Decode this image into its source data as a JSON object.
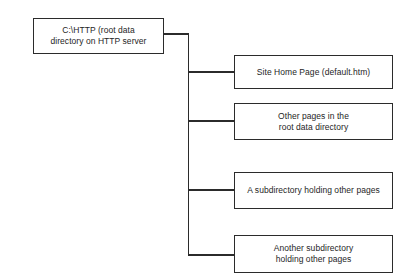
{
  "diagram": {
    "type": "tree-hierarchy",
    "orientation": "left-to-right",
    "background_color": "#ffffff",
    "line_color": "#2b2b2b",
    "box_border_color": "#2b2b2b",
    "box_fill_color": "#ffffff",
    "text_color": "#252525",
    "root": {
      "id": "root",
      "label": "C:\\HTTP (root data\ndirectory on HTTP server",
      "lines": [
        "C:\\HTTP (root data",
        "directory on HTTP server"
      ]
    },
    "children": [
      {
        "id": "home-page",
        "label": "Site Home Page (default.htm)",
        "lines": [
          "Site Home Page (default.htm)"
        ]
      },
      {
        "id": "other-pages",
        "label": "Other pages in the\nroot data directory",
        "lines": [
          "Other pages in the",
          "root data directory"
        ]
      },
      {
        "id": "subdirectory",
        "label": "A subdirectory holding other pages",
        "lines": [
          "A subdirectory holding other pages"
        ]
      },
      {
        "id": "another-subdirectory",
        "label": "Another subdirectory\nholding other pages",
        "lines": [
          "Another subdirectory",
          "holding other pages"
        ]
      }
    ],
    "connectors": {
      "trunk_x": 188,
      "trunk_top_y": 34,
      "trunk_bottom_y": 255,
      "root_exit_x": 164,
      "branch_entry_x": 234,
      "branch_y_positions": [
        72,
        121,
        190,
        255
      ]
    }
  }
}
